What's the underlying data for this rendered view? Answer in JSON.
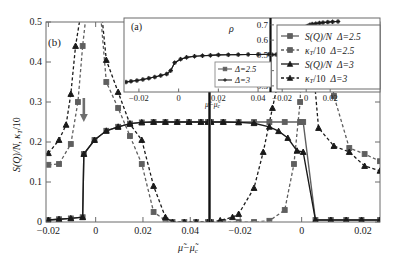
{
  "figure": {
    "panel_label_main": "(b)",
    "panel_label_inset": "(a)",
    "xlabel_main": "μ̃−μ̃",
    "xlabel_main_sub": "c",
    "ylabel_main_a": "S(Q)/N",
    "ylabel_main_b": ", κ",
    "ylabel_main_sub": "T",
    "ylabel_main_c": "/10",
    "xlabel_inset": "μ̃−μ̃",
    "xlabel_inset_sub": "c",
    "ylabel_inset": "ρ"
  },
  "main_axes": {
    "y_ticks": [
      "0",
      "0.1",
      "0.2",
      "0.3",
      "0.4",
      "0.5"
    ],
    "y_values": [
      0,
      0.1,
      0.2,
      0.3,
      0.4,
      0.5
    ],
    "left_x_ticks": [
      "−0.02",
      "0",
      "0.02",
      "0.04"
    ],
    "left_x_values": [
      -0.02,
      0,
      0.02,
      0.04
    ],
    "right_x_ticks": [
      "−0.02",
      "0",
      "0.02"
    ],
    "right_x_values": [
      -0.02,
      0,
      0.02
    ],
    "left_xlim": [
      -0.021,
      0.0475
    ],
    "right_xlim": [
      -0.0295,
      0.0255
    ],
    "ylim": [
      0,
      0.5
    ]
  },
  "inset_axes": {
    "y_ticks": [
      "0.3",
      "0.4",
      "0.5",
      "0.6",
      "0.7"
    ],
    "y_values": [
      0.3,
      0.4,
      0.5,
      0.6,
      0.7
    ],
    "left_x_ticks": [
      "−0.02",
      "0",
      "0.02",
      "0.04"
    ],
    "left_x_values": [
      -0.02,
      0,
      0.02,
      0.04
    ],
    "right_x_ticks": [
      "−0.02",
      "0",
      "0.02"
    ],
    "right_x_values": [
      -0.02,
      0,
      0.02
    ],
    "left_xlim": [
      -0.0265,
      0.0455
    ],
    "right_xlim": [
      -0.0285,
      0.0265
    ],
    "ylim": [
      0.26,
      0.745
    ]
  },
  "legend_main": {
    "items": [
      {
        "label_a": "S(Q)/N",
        "label_b": "Δ=2.5",
        "style": "solid",
        "marker": "square",
        "color": "#5f5f5f"
      },
      {
        "label_a": "κ",
        "label_sub": "T",
        "label_a2": "/10",
        "label_b": "Δ=2.5",
        "style": "dashed",
        "marker": "square",
        "color": "#5f5f5f"
      },
      {
        "label_a": "S(Q)/N",
        "label_b": "Δ=3",
        "style": "solid",
        "marker": "triangle",
        "color": "#1a1a1a"
      },
      {
        "label_a": "κ",
        "label_sub": "T",
        "label_a2": "/10",
        "label_b": "Δ=3",
        "style": "dashed",
        "marker": "triangle",
        "color": "#1a1a1a"
      }
    ]
  },
  "legend_inset": {
    "items": [
      {
        "label": "Δ=2.5",
        "marker": "square",
        "color": "#5f5f5f"
      },
      {
        "label": "Δ=3",
        "marker": "plus",
        "color": "#1a1a1a"
      }
    ]
  },
  "chart_data": {
    "type": "line",
    "title": "",
    "xlabel": "μ̃−μ̃_c",
    "ylabel": "S(Q)/N, κ_T/10",
    "panels": [
      {
        "name": "main-left",
        "xlim": [
          -0.021,
          0.0475
        ],
        "ylim": [
          0,
          0.5
        ],
        "series": [
          {
            "name": "S(Q)/N Δ=2.5",
            "style": "solid",
            "marker": "square",
            "color": "#5f5f5f",
            "x": [
              -0.02,
              -0.0155,
              -0.0105,
              -0.0055,
              -0.005,
              -0.0005,
              0.0045,
              0.0095,
              0.0145,
              0.0195,
              0.0245,
              0.0295,
              0.0345,
              0.0395,
              0.0445,
              0.0475
            ],
            "y": [
              0.005,
              0.007,
              0.009,
              0.012,
              0.17,
              0.205,
              0.228,
              0.238,
              0.246,
              0.249,
              0.25,
              0.25,
              0.25,
              0.25,
              0.25,
              0.25
            ]
          },
          {
            "name": "S(Q)/N Δ=3",
            "style": "solid",
            "marker": "triangle",
            "color": "#1a1a1a",
            "x": [
              -0.02,
              -0.0155,
              -0.0105,
              -0.0055,
              -0.005,
              -0.0005,
              0.0045,
              0.0095,
              0.0145,
              0.0195,
              0.0245,
              0.0295,
              0.0345,
              0.0395,
              0.0445,
              0.0475
            ],
            "y": [
              0.005,
              0.007,
              0.009,
              0.012,
              0.17,
              0.205,
              0.228,
              0.238,
              0.246,
              0.249,
              0.25,
              0.25,
              0.25,
              0.25,
              0.25,
              0.25
            ]
          },
          {
            "name": "κ_T/10 Δ=2.5",
            "style": "dashed",
            "marker": "square",
            "color": "#5f5f5f",
            "x": [
              -0.02,
              -0.0155,
              -0.0105,
              -0.0075,
              -0.0055,
              -0.004,
              -0.0005,
              0.0045,
              0.0095,
              0.0145,
              0.0195,
              0.0245,
              0.0295,
              0.0325,
              0.0375,
              0.0425,
              0.0475
            ],
            "y": [
              0.143,
              0.145,
              0.195,
              0.3,
              0.44,
              0.52,
              0.7,
              0.35,
              0.285,
              0.215,
              0.145,
              0.025,
              0.004,
              0.0,
              0.0,
              0.0,
              0.0
            ]
          },
          {
            "name": "κ_T/10 Δ=3",
            "style": "dashed",
            "marker": "triangle",
            "color": "#1a1a1a",
            "x": [
              -0.02,
              -0.0155,
              -0.0125,
              -0.0105,
              -0.0085,
              -0.0055,
              -0.0005,
              0.0045,
              0.0095,
              0.0145,
              0.0195,
              0.0245,
              0.0295,
              0.0325,
              0.0375,
              0.0425,
              0.0475
            ],
            "y": [
              0.172,
              0.205,
              0.243,
              0.32,
              0.44,
              0.55,
              0.7,
              0.405,
              0.325,
              0.245,
              0.205,
              0.09,
              0.012,
              0.0,
              0.0,
              0.0,
              0.0
            ]
          }
        ]
      },
      {
        "name": "main-right",
        "xlim": [
          -0.0295,
          0.0255
        ],
        "ylim": [
          0,
          0.5
        ],
        "series": [
          {
            "name": "S(Q)/N Δ=2.5",
            "style": "solid",
            "marker": "square",
            "color": "#5f5f5f",
            "x": [
              -0.0295,
              -0.0255,
              -0.0205,
              -0.0155,
              -0.0105,
              -0.0055,
              -0.0005,
              0.0,
              0.0005,
              0.0045,
              0.0095,
              0.0145,
              0.0195,
              0.0255
            ],
            "y": [
              0.25,
              0.25,
              0.25,
              0.25,
              0.25,
              0.25,
              0.25,
              0.25,
              0.25,
              0.005,
              0.005,
              0.005,
              0.005,
              0.005
            ]
          },
          {
            "name": "S(Q)/N Δ=3",
            "style": "solid",
            "marker": "triangle",
            "color": "#1a1a1a",
            "x": [
              -0.0295,
              -0.0255,
              -0.0205,
              -0.0155,
              -0.0105,
              -0.0075,
              -0.0045,
              -0.0015,
              0.0005,
              0.0045,
              0.0095,
              0.0145,
              0.0195,
              0.0255
            ],
            "y": [
              0.25,
              0.25,
              0.249,
              0.247,
              0.238,
              0.227,
              0.21,
              0.178,
              0.175,
              0.005,
              0.005,
              0.005,
              0.005,
              0.005
            ]
          },
          {
            "name": "κ_T/10 Δ=2.5",
            "style": "dashed",
            "marker": "square",
            "color": "#5f5f5f",
            "x": [
              -0.0295,
              -0.0255,
              -0.0205,
              -0.0155,
              -0.0105,
              -0.0055,
              -0.0025,
              -0.0005,
              0.0005,
              0.0035,
              0.0055,
              0.0105,
              0.0155,
              0.0205,
              0.0255
            ],
            "y": [
              0.0,
              0.0,
              0.0,
              0.0,
              0.003,
              0.03,
              0.145,
              0.3,
              0.5,
              0.7,
              0.62,
              0.315,
              0.185,
              0.17,
              0.152
            ]
          },
          {
            "name": "κ_T/10 Δ=3",
            "style": "dashed",
            "marker": "triangle",
            "color": "#1a1a1a",
            "x": [
              -0.0295,
              -0.0265,
              -0.0225,
              -0.0205,
              -0.0155,
              -0.0125,
              -0.0095,
              -0.0065,
              -0.0035,
              -0.0005,
              0.0025,
              0.0055,
              0.0105,
              0.0155,
              0.0205,
              0.0255
            ],
            "y": [
              0.0,
              0.004,
              0.012,
              0.02,
              0.085,
              0.175,
              0.285,
              0.39,
              0.53,
              0.7,
              0.5,
              0.235,
              0.19,
              0.175,
              0.14,
              0.128
            ]
          }
        ]
      },
      {
        "name": "inset-left",
        "xlim": [
          -0.0265,
          0.0455
        ],
        "ylim": [
          0.26,
          0.745
        ],
        "series": [
          {
            "name": "Δ=2.5",
            "style": "solid",
            "marker": "square",
            "color": "#4a4a4a",
            "x": [
              -0.0265,
              -0.024,
              -0.021,
              -0.018,
              -0.015,
              -0.012,
              -0.009,
              -0.006,
              -0.004,
              -0.002,
              0.001,
              0.004,
              0.008,
              0.012,
              0.016,
              0.02,
              0.025,
              0.03,
              0.035,
              0.04,
              0.0455
            ],
            "y": [
              0.325,
              0.33,
              0.335,
              0.342,
              0.35,
              0.358,
              0.368,
              0.378,
              0.4,
              0.452,
              0.475,
              0.487,
              0.494,
              0.498,
              0.5,
              0.503,
              0.504,
              0.505,
              0.506,
              0.506,
              0.507
            ]
          },
          {
            "name": "Δ=3",
            "style": "solid",
            "marker": "plus",
            "color": "#1a1a1a",
            "x": [
              -0.0265,
              -0.024,
              -0.021,
              -0.018,
              -0.015,
              -0.012,
              -0.009,
              -0.006,
              -0.004,
              -0.002,
              0.001,
              0.004,
              0.008,
              0.012,
              0.016,
              0.02,
              0.025,
              0.03,
              0.035,
              0.04,
              0.0455
            ],
            "y": [
              0.325,
              0.33,
              0.335,
              0.342,
              0.35,
              0.358,
              0.368,
              0.378,
              0.4,
              0.452,
              0.475,
              0.487,
              0.494,
              0.498,
              0.5,
              0.503,
              0.504,
              0.505,
              0.506,
              0.506,
              0.507
            ]
          }
        ]
      },
      {
        "name": "inset-right",
        "xlim": [
          -0.0285,
          0.0265
        ],
        "ylim": [
          0.26,
          0.745
        ],
        "series": [
          {
            "name": "Δ=2.5",
            "style": "solid",
            "marker": "square",
            "color": "#4a4a4a",
            "x": [
              -0.0285,
              -0.025,
              -0.022,
              -0.019,
              -0.016,
              -0.013,
              -0.01,
              -0.007,
              -0.004,
              -0.002,
              -0.0005,
              0.0,
              0.001,
              0.003,
              0.005,
              0.008,
              0.011,
              0.014,
              0.018,
              0.022,
              0.0265
            ],
            "y": [
              0.505,
              0.505,
              0.505,
              0.505,
              0.506,
              0.506,
              0.506,
              0.507,
              0.507,
              0.508,
              0.51,
              0.685,
              0.692,
              0.7,
              0.705,
              0.708,
              0.712,
              0.715,
              0.718,
              0.72,
              0.722
            ]
          },
          {
            "name": "Δ=3",
            "style": "solid",
            "marker": "plus",
            "color": "#1a1a1a",
            "x": [
              -0.0285,
              -0.025,
              -0.022,
              -0.019,
              -0.016,
              -0.013,
              -0.01,
              -0.007,
              -0.005,
              -0.003,
              -0.0015,
              -0.0005,
              0.0,
              0.001,
              0.003,
              0.005,
              0.008,
              0.011,
              0.014,
              0.018,
              0.022,
              0.0265
            ],
            "y": [
              0.505,
              0.506,
              0.508,
              0.512,
              0.518,
              0.528,
              0.542,
              0.562,
              0.585,
              0.612,
              0.638,
              0.66,
              0.685,
              0.692,
              0.7,
              0.705,
              0.708,
              0.712,
              0.715,
              0.718,
              0.72,
              0.722
            ]
          }
        ]
      }
    ],
    "annotations": [
      {
        "name": "arrow-left-panel",
        "panel": "main-left",
        "x": -0.005,
        "y": 0.25,
        "type": "down-arrow"
      },
      {
        "name": "arrow-right-panel",
        "panel": "main-right",
        "x": 0.0005,
        "y": 0.33,
        "type": "down-arrow"
      }
    ]
  }
}
